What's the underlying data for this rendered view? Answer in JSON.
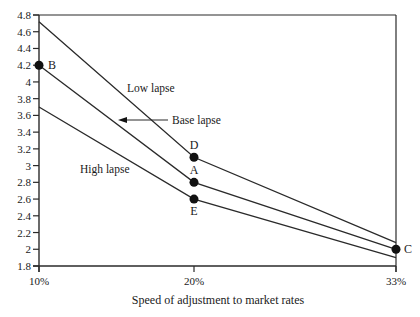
{
  "chart_data": {
    "type": "line",
    "title": "",
    "xlabel": "Speed of adjustment to market rates",
    "ylabel": "",
    "categories": [
      "10%",
      "20%",
      "33%"
    ],
    "ylim": [
      1.8,
      4.8
    ],
    "yticks": [
      1.8,
      2,
      2.2,
      2.4,
      2.6,
      2.8,
      3,
      3.2,
      3.4,
      3.6,
      3.8,
      4,
      4.2,
      4.4,
      4.6,
      4.8
    ],
    "ytick_labels": [
      "1.8",
      "2",
      "2.2",
      "2.4",
      "2.6",
      "2.8",
      "3",
      "3.2",
      "3.4",
      "3.6",
      "3.8",
      "4",
      "4.2",
      "4.4",
      "4.6",
      "4.8"
    ],
    "grid": false,
    "legend": "none",
    "series": [
      {
        "name": "Low lapse",
        "values": [
          4.72,
          3.1,
          2.08
        ]
      },
      {
        "name": "Base lapse",
        "values": [
          4.2,
          2.8,
          2.0
        ]
      },
      {
        "name": "High lapse",
        "values": [
          3.7,
          2.6,
          1.9
        ]
      }
    ],
    "points": [
      {
        "label": "B",
        "x": "10%",
        "y": 4.2,
        "series": "Base lapse"
      },
      {
        "label": "D",
        "x": "20%",
        "y": 3.1,
        "series": "Low lapse"
      },
      {
        "label": "A",
        "x": "20%",
        "y": 2.8,
        "series": "Base lapse"
      },
      {
        "label": "E",
        "x": "20%",
        "y": 2.6,
        "series": "High lapse"
      },
      {
        "label": "C",
        "x": "33%",
        "y": 2.0,
        "series": "Base lapse"
      }
    ],
    "annotations": [
      {
        "text": "Low lapse",
        "x": 127,
        "y": 92
      },
      {
        "text": "Base lapse",
        "x": 172,
        "y": 124,
        "arrow": true
      },
      {
        "text": "High lapse",
        "x": 80,
        "y": 173
      }
    ]
  }
}
